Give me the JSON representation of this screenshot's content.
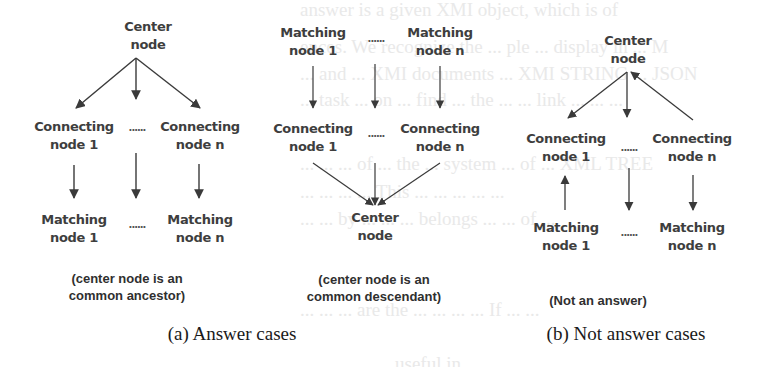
{
  "figure": {
    "panel_a": {
      "caption": "(a) Answer cases",
      "ancestor_case": {
        "center": "Center\nnode",
        "connecting_1": "Connecting\nnode 1",
        "connecting_n": "Connecting\nnode n",
        "matching_1": "Matching\nnode 1",
        "matching_n": "Matching\nnode n",
        "ellipsis_top": "......",
        "ellipsis_bottom": "......",
        "note": "(center node is an\ncommon ancestor)"
      },
      "descendant_case": {
        "matching_1": "Matching\nnode 1",
        "matching_n": "Matching\nnode n",
        "connecting_1": "Connecting\nnode 1",
        "connecting_n": "Connecting\nnode n",
        "center": "Center\nnode",
        "ellipsis_top": "......",
        "ellipsis_bottom": "......",
        "note": "(center node is an\ncommon descendant)"
      }
    },
    "panel_b": {
      "caption": "(b) Not answer cases",
      "not_answer_case": {
        "center": "Center\nnode",
        "connecting_1": "Connecting\nnode 1",
        "connecting_n": "Connecting\nnode n",
        "matching_1": "Matching\nnode 1",
        "matching_n": "Matching\nnode n",
        "ellipsis_top": "......",
        "ellipsis_bottom": "......",
        "note": "(Not an answer)"
      }
    },
    "colors": {
      "arrow": "#3a3a3a",
      "label": "#3e3e3e",
      "background": "#ffffff"
    }
  },
  "show_through_text": [
    "answer is a given XMI object, which is of",
    "...ences. We recognize ... the ... ple ... display in ... M",
    "... XMI ... documents ... XMI STRING ... JSON ... ..."
  ]
}
